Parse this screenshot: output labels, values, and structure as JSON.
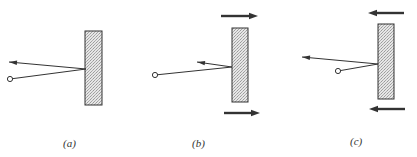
{
  "figure": {
    "colors": {
      "stroke": "#333333",
      "wall_fill": "#d8d8d8",
      "background": "#ffffff"
    },
    "panels": [
      {
        "id": "a",
        "label": "(a)",
        "wall": {
          "x": 85,
          "y": 31,
          "w": 17,
          "h": 74
        },
        "source": {
          "x": 10,
          "y": 79
        },
        "impact": {
          "x": 86,
          "y": 69
        },
        "reflected_tip": {
          "x": 9,
          "y": 62
        },
        "wall_motion": "none",
        "label_pos": {
          "x": 63,
          "y": 148
        }
      },
      {
        "id": "b",
        "label": "(b)",
        "wall": {
          "x": 232,
          "y": 28,
          "w": 16,
          "h": 74
        },
        "source": {
          "x": 155,
          "y": 75
        },
        "impact": {
          "x": 232,
          "y": 67
        },
        "reflected_tip": {
          "x": 197,
          "y": 62
        },
        "wall_motion": "right",
        "arrows": [
          {
            "x1": 221,
            "y1": 16,
            "x2": 258,
            "y2": 16
          },
          {
            "x1": 224,
            "y1": 113,
            "x2": 260,
            "y2": 113
          }
        ],
        "label_pos": {
          "x": 192,
          "y": 148
        }
      },
      {
        "id": "c",
        "label": "(c)",
        "wall": {
          "x": 378,
          "y": 24,
          "w": 16,
          "h": 75
        },
        "source": {
          "x": 338,
          "y": 71
        },
        "impact": {
          "x": 378,
          "y": 64
        },
        "reflected_tip": {
          "x": 302,
          "y": 57
        },
        "wall_motion": "left",
        "arrows": [
          {
            "x1": 404,
            "y1": 13,
            "x2": 368,
            "y2": 13
          },
          {
            "x1": 405,
            "y1": 109,
            "x2": 369,
            "y2": 109
          }
        ],
        "label_pos": {
          "x": 350,
          "y": 146
        }
      }
    ]
  }
}
